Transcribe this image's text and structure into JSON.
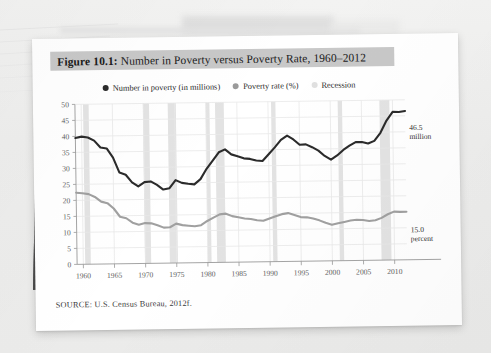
{
  "figure": {
    "label_prefix": "Figure 10.1:",
    "title": "Number in Poverty versus Poverty Rate, 1960–2012",
    "source": "SOURCE: U.S. Census Bureau, 2012f."
  },
  "legend": {
    "items": [
      {
        "label": "Number in poverty (in millions)",
        "color": "#2b2b2b",
        "marker": "dot"
      },
      {
        "label": "Poverty rate (%)",
        "color": "#9a9a9a",
        "marker": "dot"
      },
      {
        "label": "Recession",
        "color": "#e0e0e0",
        "marker": "dot"
      }
    ]
  },
  "annotations": {
    "number_value": "46.5",
    "number_unit": "million",
    "rate_value": "15.0",
    "rate_unit": "percent"
  },
  "colors": {
    "number_line": "#2b2b2b",
    "rate_line": "#a0a0a0",
    "recession_band": "#e3e3e3",
    "grid": "#e8e8e8",
    "axis": "#9a9a9a",
    "title_bar": "#c8c8c8",
    "page": "#ffffff"
  },
  "chart_data": {
    "type": "line",
    "title": "Number in Poverty versus Poverty Rate, 1960–2012",
    "xlabel": "",
    "ylabel": "",
    "xlim": [
      1959,
      2012
    ],
    "ylim": [
      0,
      50
    ],
    "ytick_step": 5,
    "yticks": [
      0,
      5,
      10,
      15,
      20,
      25,
      30,
      35,
      40,
      45,
      50
    ],
    "xticks": [
      1960,
      1965,
      1970,
      1975,
      1980,
      1985,
      1990,
      1995,
      2000,
      2005,
      2010
    ],
    "grid": true,
    "legend_position": "top",
    "x": [
      1959,
      1960,
      1961,
      1962,
      1963,
      1964,
      1965,
      1966,
      1967,
      1968,
      1969,
      1970,
      1971,
      1972,
      1973,
      1974,
      1975,
      1976,
      1977,
      1978,
      1979,
      1980,
      1981,
      1982,
      1983,
      1984,
      1985,
      1986,
      1987,
      1988,
      1989,
      1990,
      1991,
      1992,
      1993,
      1994,
      1995,
      1996,
      1997,
      1998,
      1999,
      2000,
      2001,
      2002,
      2003,
      2004,
      2005,
      2006,
      2007,
      2008,
      2009,
      2010,
      2011,
      2012
    ],
    "series": [
      {
        "name": "Number in poverty (in millions)",
        "color": "#2b2b2b",
        "values": [
          39.5,
          39.9,
          39.6,
          38.6,
          36.4,
          36.1,
          33.2,
          28.5,
          27.8,
          25.4,
          24.1,
          25.4,
          25.6,
          24.5,
          23.0,
          23.4,
          25.9,
          25.0,
          24.7,
          24.5,
          26.1,
          29.3,
          31.8,
          34.4,
          35.3,
          33.7,
          33.1,
          32.4,
          32.2,
          31.7,
          31.5,
          33.6,
          35.7,
          38.0,
          39.3,
          38.1,
          36.4,
          36.5,
          35.6,
          34.5,
          32.8,
          31.6,
          32.9,
          34.6,
          35.9,
          37.0,
          37.0,
          36.5,
          37.3,
          39.8,
          43.6,
          46.3,
          46.2,
          46.5
        ]
      },
      {
        "name": "Poverty rate (%)",
        "color": "#a0a0a0",
        "values": [
          22.4,
          22.2,
          21.9,
          21.0,
          19.5,
          19.0,
          17.3,
          14.7,
          14.2,
          12.8,
          12.1,
          12.6,
          12.5,
          11.9,
          11.1,
          11.2,
          12.3,
          11.8,
          11.6,
          11.4,
          11.7,
          13.0,
          14.0,
          15.0,
          15.2,
          14.4,
          14.0,
          13.6,
          13.4,
          13.0,
          12.8,
          13.5,
          14.2,
          14.8,
          15.1,
          14.5,
          13.8,
          13.7,
          13.3,
          12.7,
          11.9,
          11.3,
          11.7,
          12.1,
          12.5,
          12.7,
          12.6,
          12.3,
          12.5,
          13.2,
          14.3,
          15.1,
          15.0,
          15.0
        ]
      }
    ],
    "recessions": [
      [
        1960.3,
        1961.2
      ],
      [
        1969.9,
        1970.9
      ],
      [
        1973.9,
        1975.2
      ],
      [
        1980.0,
        1980.6
      ],
      [
        1981.5,
        1982.9
      ],
      [
        1990.5,
        1991.2
      ],
      [
        2001.2,
        2001.9
      ],
      [
        2007.9,
        2009.5
      ]
    ],
    "annotations": [
      {
        "text": "46.5 million",
        "x": 2012,
        "y": 46.5
      },
      {
        "text": "15.0 percent",
        "x": 2012,
        "y": 15.0
      }
    ]
  }
}
